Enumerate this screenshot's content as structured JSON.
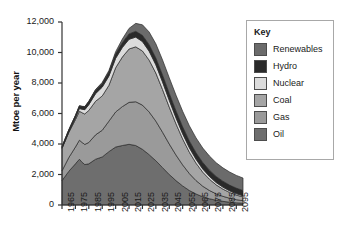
{
  "chart_data": {
    "type": "area",
    "stacked": true,
    "title": "",
    "subtitle": "",
    "xlabel": "",
    "ylabel": "Mtoe per year",
    "xlim": [
      1965,
      2100
    ],
    "ylim": [
      0,
      12000
    ],
    "ytick_labels": [
      "0",
      "2,000",
      "4,000",
      "6,000",
      "8,000",
      "10,000",
      "12,000"
    ],
    "ytick_values": [
      0,
      2000,
      4000,
      6000,
      8000,
      10000,
      12000
    ],
    "xtick_labels": [
      "1965",
      "1975",
      "1985",
      "1995",
      "2005",
      "2015",
      "2025",
      "2035",
      "2045",
      "2055",
      "2065",
      "2075",
      "2085",
      "2095"
    ],
    "xtick_values": [
      1965,
      1975,
      1985,
      1995,
      2005,
      2015,
      2025,
      2035,
      2045,
      2055,
      2065,
      2075,
      2085,
      2095
    ],
    "grid": false,
    "legend_position": "right",
    "legend_title": "Key",
    "x": [
      1965,
      1970,
      1975,
      1978,
      1980,
      1982,
      1985,
      1990,
      1995,
      2000,
      2005,
      2010,
      2015,
      2020,
      2025,
      2030,
      2035,
      2040,
      2045,
      2050,
      2055,
      2060,
      2065,
      2070,
      2075,
      2080,
      2085,
      2090,
      2095,
      2100
    ],
    "series": [
      {
        "name": "Oil",
        "color": "#6e6e6e",
        "values": [
          1600,
          2200,
          2700,
          3000,
          2800,
          2650,
          2700,
          3000,
          3150,
          3500,
          3800,
          3900,
          3980,
          3900,
          3650,
          3300,
          2900,
          2450,
          2000,
          1600,
          1250,
          950,
          720,
          540,
          410,
          310,
          240,
          185,
          145,
          115
        ]
      },
      {
        "name": "Gas",
        "color": "#9a9a9a",
        "values": [
          640,
          900,
          1100,
          1250,
          1300,
          1320,
          1400,
          1600,
          1750,
          2000,
          2300,
          2550,
          2750,
          2870,
          2900,
          2800,
          2600,
          2320,
          2000,
          1680,
          1380,
          1110,
          880,
          690,
          540,
          420,
          330,
          260,
          205,
          165
        ]
      },
      {
        "name": "Coal",
        "color": "#a5a5a5",
        "values": [
          1480,
          1650,
          1800,
          1900,
          1950,
          2000,
          2100,
          2200,
          2250,
          2350,
          2900,
          3250,
          3500,
          3600,
          3550,
          3400,
          3150,
          2800,
          2420,
          2050,
          1700,
          1400,
          1140,
          920,
          740,
          590,
          475,
          380,
          305,
          245
        ]
      },
      {
        "name": "Nuclear",
        "color": "#dcdcdc",
        "values": [
          10,
          30,
          110,
          180,
          230,
          280,
          380,
          500,
          580,
          610,
          620,
          630,
          640,
          640,
          620,
          590,
          550,
          500,
          450,
          395,
          345,
          295,
          255,
          215,
          185,
          155,
          130,
          110,
          92,
          78
        ]
      },
      {
        "name": "Hydro",
        "color": "#2a2a2a",
        "values": [
          100,
          130,
          150,
          165,
          175,
          185,
          200,
          225,
          245,
          265,
          290,
          320,
          350,
          380,
          405,
          425,
          440,
          450,
          455,
          455,
          450,
          440,
          430,
          420,
          408,
          396,
          384,
          372,
          360,
          350
        ]
      },
      {
        "name": "Renewables",
        "color": "#6b6b6b",
        "values": [
          5,
          8,
          12,
          15,
          18,
          22,
          30,
          45,
          65,
          95,
          140,
          230,
          360,
          520,
          690,
          830,
          930,
          990,
          1020,
          1030,
          1020,
          1000,
          975,
          950,
          925,
          900,
          878,
          856,
          835,
          815
        ]
      }
    ],
    "legend_entries": [
      {
        "label": "Renewables",
        "color": "#6b6b6b"
      },
      {
        "label": "Hydro",
        "color": "#2a2a2a"
      },
      {
        "label": "Nuclear",
        "color": "#dcdcdc"
      },
      {
        "label": "Coal",
        "color": "#a5a5a5"
      },
      {
        "label": "Gas",
        "color": "#9a9a9a"
      },
      {
        "label": "Oil",
        "color": "#6e6e6e"
      }
    ],
    "axis_color": "#333333"
  }
}
